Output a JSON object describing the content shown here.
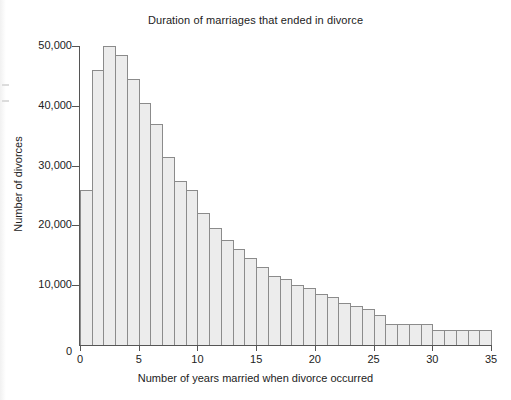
{
  "chart_data": {
    "type": "bar",
    "title": "Duration of marriages that ended in divorce",
    "xlabel": "Number of years married when divorce occurred",
    "ylabel": "Number of divorces",
    "grid": false,
    "legend": "none",
    "xlim": [
      0,
      35
    ],
    "ylim": [
      0,
      50000
    ],
    "bin_width": 1,
    "x_tick_labels": [
      "0",
      "5",
      "10",
      "15",
      "20",
      "25",
      "30",
      "35"
    ],
    "x_tick_values": [
      0,
      5,
      10,
      15,
      20,
      25,
      30,
      35
    ],
    "y_tick_labels": [
      "0",
      "10,000",
      "20,000",
      "30,000",
      "40,000",
      "50,000"
    ],
    "y_tick_values": [
      0,
      10000,
      20000,
      30000,
      40000,
      50000
    ],
    "bin_starts": [
      0,
      1,
      2,
      3,
      4,
      5,
      6,
      7,
      8,
      9,
      10,
      11,
      12,
      13,
      14,
      15,
      16,
      17,
      18,
      19,
      20,
      21,
      22,
      23,
      24,
      25,
      26,
      27,
      28,
      29,
      30,
      31,
      32,
      33,
      34
    ],
    "values": [
      26000,
      46000,
      50000,
      48500,
      44500,
      40500,
      37000,
      31500,
      27500,
      26000,
      22000,
      19500,
      17500,
      16000,
      14500,
      13000,
      11500,
      11000,
      10000,
      9500,
      8500,
      8000,
      7000,
      6500,
      6000,
      5000,
      3500,
      3500,
      3500,
      3500,
      2500,
      2500,
      2500,
      2500,
      2500
    ]
  },
  "colors": {
    "bar_fill": "#ececec",
    "bar_stroke": "#8b8b8b",
    "axis": "#555555",
    "text": "#222222",
    "background": "#ffffff"
  }
}
